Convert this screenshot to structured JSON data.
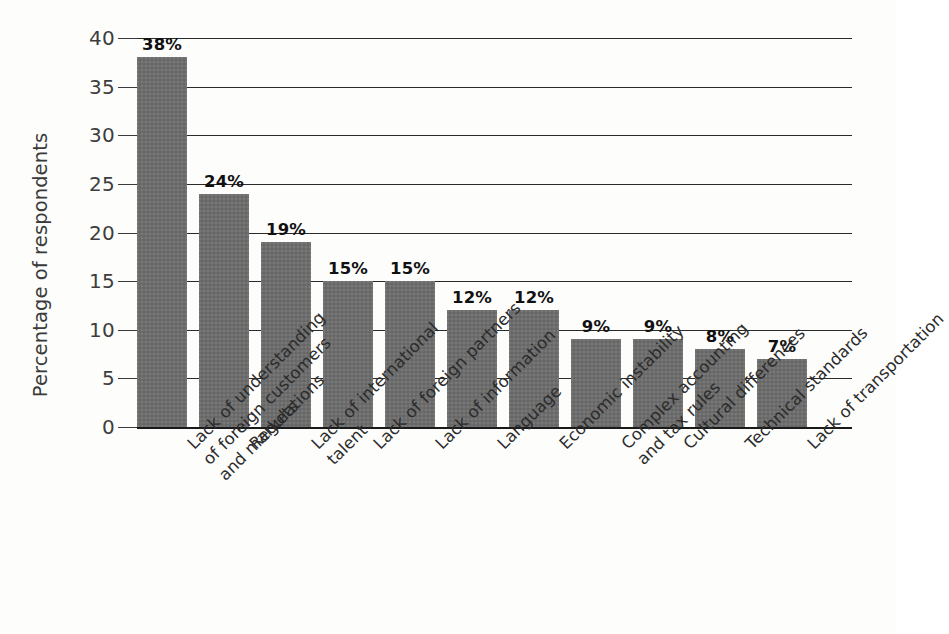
{
  "chart_data": {
    "type": "bar",
    "title": "",
    "xlabel": "",
    "ylabel": "Percentage of respondents",
    "ylim": [
      0,
      40
    ],
    "ytick_step": 5,
    "grid": true,
    "legend": "none",
    "orientation": "vertical",
    "value_label_suffix": "%",
    "categories": [
      "Lack of understanding of foreign customers and markets",
      "Regulations",
      "Lack of international talent",
      "Lack of foreign partners",
      "Lack of information",
      "Language",
      "Economic instability",
      "Complex accounting and tax rules",
      "Cultural differences",
      "Technical standards",
      "Lack of transportation"
    ],
    "category_lines": [
      [
        "Lack of understanding",
        "of foreign customers",
        "and markets"
      ],
      [
        "Regulations"
      ],
      [
        "Lack of international",
        "talent"
      ],
      [
        "Lack of foreign partners"
      ],
      [
        "Lack of information"
      ],
      [
        "Language"
      ],
      [
        "Economic instability"
      ],
      [
        "Complex accounting",
        "and tax rules"
      ],
      [
        "Cultural differences"
      ],
      [
        "Technical standards"
      ],
      [
        "Lack of transportation"
      ]
    ],
    "values": [
      38,
      24,
      19,
      15,
      15,
      12,
      12,
      9,
      9,
      8,
      7
    ],
    "value_labels": [
      "38%",
      "24%",
      "19%",
      "15%",
      "15%",
      "12%",
      "12%",
      "9%",
      "9%",
      "8%",
      "7%"
    ],
    "ytick_labels": [
      "0",
      "5",
      "10",
      "15",
      "20",
      "25",
      "30",
      "35",
      "40"
    ],
    "ytick_values": [
      0,
      5,
      10,
      15,
      20,
      25,
      30,
      35,
      40
    ],
    "colors": {
      "bar_fill": "#6d6d6d",
      "gridline": "#2a2a2a",
      "axis": "#1a1a1a",
      "text": "#2b2b2b",
      "background": "#fdfdfc"
    }
  }
}
